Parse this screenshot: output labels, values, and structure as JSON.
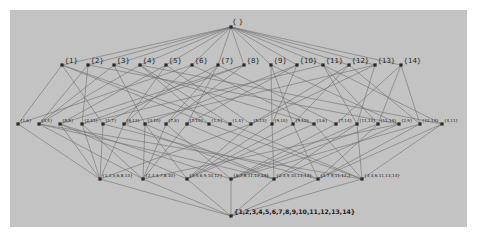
{
  "diagram": {
    "type": "lattice",
    "colors": {
      "page_background": "#ffffff",
      "panel_background": "#c3c3c3",
      "edge": "#6e6e6e",
      "node": "#2a2a2a",
      "label": "#1c1c1c"
    },
    "levels": [
      {
        "id": "top",
        "y": 27,
        "nodes": [
          {
            "label": "{ }",
            "x": 231
          }
        ]
      },
      {
        "id": "r2",
        "y": 65,
        "nodes": [
          {
            "label": "{1}",
            "x": 62
          },
          {
            "label": "{2}",
            "x": 88
          },
          {
            "label": "{3}",
            "x": 114
          },
          {
            "label": "{4}",
            "x": 140
          },
          {
            "label": "{5}",
            "x": 166
          },
          {
            "label": "{6}",
            "x": 192
          },
          {
            "label": "{7}",
            "x": 218
          },
          {
            "label": "{8}",
            "x": 244
          },
          {
            "label": "{9}",
            "x": 271
          },
          {
            "label": "{10}",
            "x": 297
          },
          {
            "label": "{11}",
            "x": 323
          },
          {
            "label": "{12}",
            "x": 349
          },
          {
            "label": "{13}",
            "x": 375
          },
          {
            "label": "{14}",
            "x": 401
          }
        ]
      },
      {
        "id": "r3",
        "y": 124,
        "nodes": [
          {
            "label": "{1,6}",
            "x": 18
          },
          {
            "label": "{3,4}",
            "x": 39
          },
          {
            "label": "{5,8}",
            "x": 60
          },
          {
            "label": "{2,11}",
            "x": 82
          },
          {
            "label": "{1,7}",
            "x": 103
          },
          {
            "label": "{6,13}",
            "x": 124
          },
          {
            "label": "{3,10}",
            "x": 145
          },
          {
            "label": "{7,8}",
            "x": 166
          },
          {
            "label": "{7,10}",
            "x": 187
          },
          {
            "label": "{1,4}",
            "x": 209
          },
          {
            "label": "{1,4}",
            "x": 230
          },
          {
            "label": "{5,13}",
            "x": 251
          },
          {
            "label": "{9,10}",
            "x": 272
          },
          {
            "label": "{9,12}",
            "x": 293
          },
          {
            "label": "{3,6}",
            "x": 314
          },
          {
            "label": "{7,14}",
            "x": 336
          },
          {
            "label": "{11,13}",
            "x": 357
          },
          {
            "label": "{11,14}",
            "x": 378
          },
          {
            "label": "{2,9}",
            "x": 399
          },
          {
            "label": "{12,14}",
            "x": 420
          },
          {
            "label": "{4,11}",
            "x": 442
          }
        ]
      },
      {
        "id": "r4",
        "y": 179,
        "nodes": [
          {
            "label": "{1,2,5,6,8,13}",
            "x": 100
          },
          {
            "label": "{2,3,4,7,8,10}",
            "x": 143
          },
          {
            "label": "{3,5,6,9,10,12}",
            "x": 187
          },
          {
            "label": "{5,7,8,11,12,14}",
            "x": 231
          },
          {
            "label": "{2,3,9,10,13,14}",
            "x": 274
          },
          {
            "label": "{1,7,9,11,12,}",
            "x": 318
          },
          {
            "label": "{3,4,6,11,13,14}",
            "x": 362
          }
        ]
      },
      {
        "id": "bottom",
        "y": 216,
        "nodes": [
          {
            "label": "{1,2,3,4,5,6,7,8,9,10,11,12,13,14}",
            "x": 231
          }
        ]
      }
    ],
    "edges_r2_r3": [
      [
        0,
        0
      ],
      [
        0,
        4
      ],
      [
        0,
        9
      ],
      [
        0,
        10
      ],
      [
        1,
        3
      ],
      [
        1,
        18
      ],
      [
        1,
        1
      ],
      [
        2,
        1
      ],
      [
        2,
        6
      ],
      [
        2,
        14
      ],
      [
        3,
        1
      ],
      [
        3,
        9
      ],
      [
        3,
        20
      ],
      [
        3,
        10
      ],
      [
        4,
        2
      ],
      [
        4,
        11
      ],
      [
        4,
        5
      ],
      [
        5,
        0
      ],
      [
        5,
        5
      ],
      [
        5,
        14
      ],
      [
        6,
        4
      ],
      [
        6,
        7
      ],
      [
        6,
        8
      ],
      [
        6,
        15
      ],
      [
        7,
        2
      ],
      [
        7,
        7
      ],
      [
        7,
        3
      ],
      [
        8,
        12
      ],
      [
        8,
        13
      ],
      [
        8,
        18
      ],
      [
        9,
        6
      ],
      [
        9,
        8
      ],
      [
        9,
        12
      ],
      [
        10,
        3
      ],
      [
        10,
        16
      ],
      [
        10,
        17
      ],
      [
        10,
        20
      ],
      [
        11,
        13
      ],
      [
        11,
        19
      ],
      [
        11,
        11
      ],
      [
        12,
        5
      ],
      [
        12,
        11
      ],
      [
        12,
        16
      ],
      [
        13,
        15
      ],
      [
        13,
        17
      ],
      [
        13,
        19
      ]
    ],
    "edges_r3_r4": [
      [
        0,
        0
      ],
      [
        2,
        0
      ],
      [
        3,
        0
      ],
      [
        5,
        0
      ],
      [
        11,
        0
      ],
      [
        4,
        0
      ],
      [
        1,
        1
      ],
      [
        3,
        1
      ],
      [
        6,
        1
      ],
      [
        7,
        1
      ],
      [
        8,
        1
      ],
      [
        18,
        1
      ],
      [
        6,
        2
      ],
      [
        11,
        2
      ],
      [
        12,
        2
      ],
      [
        13,
        2
      ],
      [
        14,
        2
      ],
      [
        2,
        2
      ],
      [
        2,
        3
      ],
      [
        7,
        3
      ],
      [
        15,
        3
      ],
      [
        16,
        3
      ],
      [
        17,
        3
      ],
      [
        19,
        3
      ],
      [
        1,
        4
      ],
      [
        6,
        4
      ],
      [
        12,
        4
      ],
      [
        18,
        4
      ],
      [
        16,
        4
      ],
      [
        5,
        4
      ],
      [
        4,
        5
      ],
      [
        8,
        5
      ],
      [
        13,
        5
      ],
      [
        17,
        5
      ],
      [
        20,
        5
      ],
      [
        19,
        5
      ],
      [
        1,
        6
      ],
      [
        10,
        6
      ],
      [
        14,
        6
      ],
      [
        16,
        6
      ],
      [
        20,
        6
      ],
      [
        9,
        6
      ]
    ]
  }
}
